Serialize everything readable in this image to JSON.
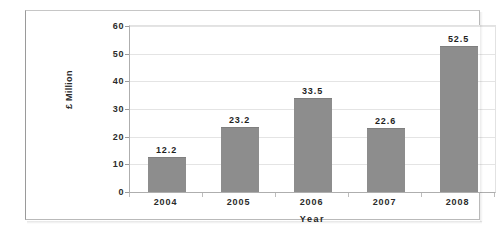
{
  "chart_data": {
    "type": "bar",
    "title": "",
    "xlabel": "Year",
    "ylabel": "£ Million",
    "categories": [
      "2004",
      "2005",
      "2006",
      "2007",
      "2008"
    ],
    "values": [
      12.2,
      23.2,
      33.5,
      22.6,
      52.5
    ],
    "value_labels": [
      "12.2",
      "23.2",
      "33.5",
      "22.6",
      "52.5"
    ],
    "ylim": [
      0,
      60
    ],
    "yticks": [
      0,
      10,
      20,
      30,
      40,
      50,
      60
    ],
    "ytick_labels": [
      "0",
      "10",
      "20",
      "30",
      "40",
      "50",
      "60"
    ],
    "grid": true,
    "grid_axis": "y",
    "legend": false,
    "legend_position": "none",
    "series": [
      {
        "name": "£ Million",
        "values": [
          12.2,
          23.2,
          33.5,
          22.6,
          52.5
        ],
        "color": "#8d8d8d"
      }
    ]
  },
  "colors": {
    "bar_fill": "#8d8d8d",
    "gridline": "#e4e4e4",
    "axis_line": "#aeaeae",
    "frame_border": "#b9b9b9",
    "text": "#1f1f1f",
    "background": "#ffffff"
  }
}
